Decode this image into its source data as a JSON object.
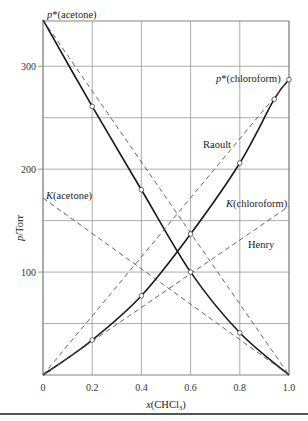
{
  "chart_data": {
    "type": "line",
    "title": "",
    "xlabel": "x(CHCl3)",
    "ylabel": "p/Torr",
    "xlim": [
      0,
      1.0
    ],
    "ylim": [
      0,
      344
    ],
    "grid": true,
    "x_ticks": [
      "0",
      "0.2",
      "0.4",
      "0.6",
      "0.8",
      "1.0"
    ],
    "x_tick_values": [
      0,
      0.2,
      0.4,
      0.6,
      0.8,
      1.0
    ],
    "y_ticks": [
      "100",
      "200",
      "300"
    ],
    "y_tick_values": [
      100,
      200,
      300
    ],
    "y_grid_values": [
      50,
      100,
      150,
      200,
      250,
      300
    ],
    "series": [
      {
        "name": "acetone (measured)",
        "style": "solid",
        "x": [
          0,
          0.2,
          0.4,
          0.6,
          0.8,
          1.0
        ],
        "values": [
          345,
          261,
          180,
          100,
          41,
          0
        ],
        "markers_at": [
          0.2,
          0.4,
          0.6,
          0.8
        ]
      },
      {
        "name": "chloroform (measured)",
        "style": "solid",
        "x": [
          0,
          0.2,
          0.4,
          0.6,
          0.8,
          0.94,
          1.0
        ],
        "values": [
          0,
          34,
          77,
          137,
          206,
          268,
          287
        ],
        "markers_at": [
          0.2,
          0.4,
          0.6,
          0.8,
          0.94,
          1.0
        ]
      },
      {
        "name": "Raoult (acetone)",
        "style": "dashed",
        "x": [
          0,
          1.0
        ],
        "values": [
          345,
          0
        ]
      },
      {
        "name": "Raoult (chloroform)",
        "style": "dashed",
        "x": [
          0,
          1.0
        ],
        "values": [
          0,
          287
        ]
      },
      {
        "name": "Henry (acetone)",
        "style": "dashed",
        "x": [
          0,
          1.0
        ],
        "values": [
          172,
          0
        ]
      },
      {
        "name": "Henry (chloroform)",
        "style": "dashed",
        "x": [
          0,
          1.0
        ],
        "values": [
          0,
          164
        ]
      }
    ],
    "annotations": [
      {
        "text": "p*(acetone)",
        "x": 0.0,
        "y": 345
      },
      {
        "text": "p*(chloroform)",
        "x": 1.0,
        "y": 287
      },
      {
        "text": "Raoult",
        "x": 0.73,
        "y": 228
      },
      {
        "text": "K(acetone)",
        "x": 0.0,
        "y": 172
      },
      {
        "text": "K(chloroform)",
        "x": 0.82,
        "y": 150
      },
      {
        "text": "Henry",
        "x": 0.88,
        "y": 118
      }
    ]
  },
  "labels": {
    "p_star_acetone_pre": "p",
    "p_star_acetone_post": "*(acetone)",
    "p_star_chloroform_pre": "p",
    "p_star_chloroform_post": "*(chloroform)",
    "raoult": "Raoult",
    "k_acetone_pre": "K",
    "k_acetone_post": "(acetone)",
    "k_chloroform_pre": "K",
    "k_chloroform_post": "(chloroform)",
    "henry": "Henry",
    "ylabel_p": "p",
    "ylabel_rest": "/Torr",
    "xlabel_x": "x",
    "xlabel_rest": "(CHCl",
    "xlabel_sub": "3",
    "xlabel_close": ")"
  }
}
